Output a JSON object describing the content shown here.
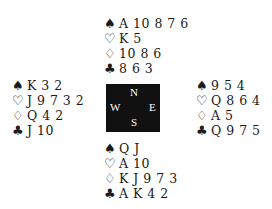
{
  "hands": {
    "north": {
      "spades": "A 10 8 7 6",
      "hearts": "K 5",
      "diamonds": "10 8 6",
      "clubs": "8 6 3"
    },
    "west": {
      "spades": "K 3 2",
      "hearts": "J 9 7 3 2",
      "diamonds": "Q 4 2",
      "clubs": "J 10"
    },
    "east": {
      "spades": "9 5 4",
      "hearts": "Q 8 6 4",
      "diamonds": "A 5",
      "clubs": "Q 9 7 5"
    },
    "south": {
      "spades": "Q J",
      "hearts": "A 10",
      "diamonds": "K J 9 7 3",
      "clubs": "A K 4 2"
    }
  },
  "suit_symbols": {
    "spades": "♠",
    "hearts": "♡",
    "diamonds": "♢",
    "clubs": "♣"
  },
  "compass": {
    "north": "N",
    "south": "S",
    "east": "E",
    "west": "W",
    "background": "#111111"
  }
}
